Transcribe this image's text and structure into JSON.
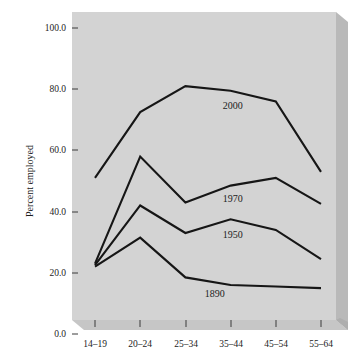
{
  "chart_data": {
    "type": "line",
    "title": "",
    "subtitle": "",
    "xlabel": "",
    "ylabel": "Percent employed",
    "categories": [
      "14–19",
      "20–24",
      "25–34",
      "35–44",
      "45–54",
      "55–64"
    ],
    "ylim": [
      0.0,
      100.0
    ],
    "ytick_labels": [
      "0.0",
      "20.0",
      "40.0",
      "60.0",
      "80.0",
      "100.0"
    ],
    "ytick_values": [
      0.0,
      20.0,
      40.0,
      60.0,
      80.0,
      100.0
    ],
    "grid": false,
    "legend_position": "inline-annotations",
    "series": [
      {
        "name": "2000",
        "values": [
          51.0,
          72.5,
          81.0,
          79.5,
          76.0,
          53.0
        ],
        "label_text": "2000",
        "label_x": 3.05,
        "label_y": 73.5
      },
      {
        "name": "1970",
        "values": [
          23.0,
          58.0,
          43.0,
          48.5,
          51.0,
          42.5
        ],
        "label_text": "1970",
        "label_x": 3.05,
        "label_y": 43.0
      },
      {
        "name": "1950",
        "values": [
          22.5,
          42.0,
          33.0,
          37.5,
          34.0,
          24.5
        ],
        "label_text": "1950",
        "label_x": 3.05,
        "label_y": 31.5
      },
      {
        "name": "1890",
        "values": [
          22.0,
          31.5,
          18.5,
          16.0,
          15.5,
          15.0
        ],
        "label_text": "1890",
        "label_x": 2.65,
        "label_y": 12.0
      }
    ],
    "colors": {
      "line": "#161616",
      "plot_background": "#d3d3d3",
      "bevel_shadow": "#b4b4b4",
      "page_background": "#ffffff",
      "text": "#1c1c1c"
    }
  }
}
